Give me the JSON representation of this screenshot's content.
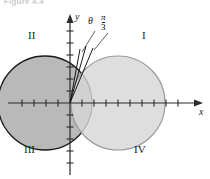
{
  "figure": {
    "caption": "Figure 4.4",
    "background": "#ffffff"
  },
  "axes": {
    "x_label": "x",
    "y_label": "y",
    "axis_color": "#2b2b2b",
    "origin": {
      "x": 70,
      "y": 103
    },
    "x_range_px": {
      "min": 8,
      "max": 200
    },
    "y_range_px": {
      "min": 14,
      "max": 175
    },
    "tick_spacing_px": 12,
    "tick_len_px": 7,
    "x_ticks_left": 5,
    "x_ticks_right": 10,
    "y_ticks_up": 6,
    "y_ticks_down": 5
  },
  "quadrants": [
    {
      "name": "I",
      "label": "I",
      "x": 142,
      "y": 36
    },
    {
      "name": "II",
      "label": "II",
      "x": 31,
      "y": 36
    },
    {
      "name": "III",
      "label": "III",
      "x": 27,
      "y": 150
    },
    {
      "name": "IV",
      "label": "IV",
      "x": 137,
      "y": 150
    }
  ],
  "circles": [
    {
      "name": "left-circle",
      "label": "r = -4 cos(theta)",
      "center": {
        "x": 45,
        "y": 103
      },
      "radius": 47,
      "fill": "#b9b9b9",
      "stroke": "#1a1a1a",
      "stroke_width": 1.3
    },
    {
      "name": "right-circle",
      "label": "r = 4 cos(theta)",
      "center": {
        "x": 118,
        "y": 103
      },
      "radius": 47,
      "fill": "#d7d7d7",
      "stroke": "#9a9a9a",
      "stroke_width": 1.2
    }
  ],
  "rays": [
    {
      "name": "theta-ray",
      "from": {
        "x": 70,
        "y": 103
      },
      "to": {
        "x": 86,
        "y": 46
      }
    },
    {
      "name": "pi3-ray",
      "from": {
        "x": 70,
        "y": 103
      },
      "to": {
        "x": 92,
        "y": 47
      }
    },
    {
      "name": "inner-ray",
      "from": {
        "x": 70,
        "y": 103
      },
      "to": {
        "x": 81,
        "y": 48
      }
    }
  ],
  "leaders": [
    {
      "name": "theta-leader",
      "from": {
        "x": 96,
        "y": 33
      },
      "to": {
        "x": 83,
        "y": 52
      }
    },
    {
      "name": "pi3-leader",
      "from": {
        "x": 110,
        "y": 34
      },
      "to": {
        "x": 93,
        "y": 50
      }
    }
  ],
  "angle_labels": {
    "theta": {
      "text": "θ",
      "x": 90,
      "y": 20
    },
    "pi_over_3": {
      "numerator": "π",
      "denominator": "3",
      "x": 104,
      "y": 18
    }
  }
}
